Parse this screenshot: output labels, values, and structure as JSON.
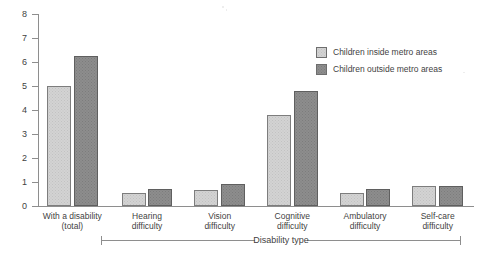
{
  "chart_data": {
    "type": "bar",
    "title": "",
    "xlabel": "Disability type",
    "ylabel": "",
    "ylim": [
      0,
      8
    ],
    "ytick_step": 1,
    "grid": false,
    "legend_position": "upper-right",
    "categories": [
      "With a disability\n(total)",
      "Hearing\ndifficulty",
      "Vision\ndifficulty",
      "Cognitive\ndifficulty",
      "Ambulatory\ndifficulty",
      "Self-care\ndifficulty"
    ],
    "category_lines": [
      [
        "With a disability",
        "(total)"
      ],
      [
        "Hearing",
        "difficulty"
      ],
      [
        "Vision",
        "difficulty"
      ],
      [
        "Cognitive",
        "difficulty"
      ],
      [
        "Ambulatory",
        "difficulty"
      ],
      [
        "Self-care",
        "difficulty"
      ]
    ],
    "series": [
      {
        "name": "Children inside metro areas",
        "color": "#d3d3d3",
        "values": [
          5.0,
          0.55,
          0.65,
          3.8,
          0.55,
          0.85
        ]
      },
      {
        "name": "Children outside metro areas",
        "color": "#8d8d8d",
        "values": [
          6.25,
          0.7,
          0.9,
          4.8,
          0.7,
          0.85
        ]
      }
    ],
    "ytick_labels": [
      "0",
      "1",
      "2",
      "3",
      "4",
      "5",
      "6",
      "7",
      "8"
    ]
  },
  "legend": {
    "items": [
      {
        "label": "Children inside metro areas",
        "swatch": "inside"
      },
      {
        "label": "Children outside metro areas",
        "swatch": "outside"
      }
    ]
  },
  "axis": {
    "bracket_label": "Disability type"
  }
}
